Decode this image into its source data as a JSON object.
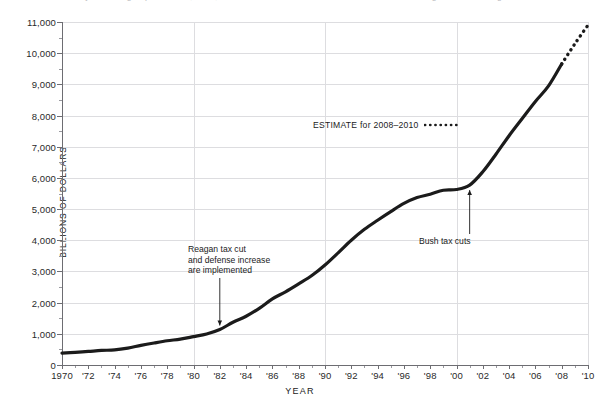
{
  "caption": {
    "text": "fiscal year ending September 30, 2008; 2009 and 2010 are estimates. Source: Office of Management and Budget"
  },
  "chart_data": {
    "type": "line",
    "title": "",
    "subtitle": "",
    "xlabel": "YEAR",
    "ylabel": "BILLIONS OF DOLLARS",
    "xlim": [
      1970,
      2010
    ],
    "ylim": [
      0,
      11000
    ],
    "grid": "major gridlines every 1,000 on y and every 10 years on x",
    "legend_position": "inside-upper-center",
    "y_ticks": [
      0,
      1000,
      2000,
      3000,
      4000,
      5000,
      6000,
      7000,
      8000,
      9000,
      10000,
      11000
    ],
    "y_tick_labels": [
      "0",
      "1,000",
      "2,000",
      "3,000",
      "4,000",
      "5,000",
      "6,000",
      "7,000",
      "8,000",
      "9,000",
      "10,000",
      "11,000"
    ],
    "x_ticks": [
      1970,
      1972,
      1974,
      1976,
      1978,
      1980,
      1982,
      1984,
      1986,
      1988,
      1990,
      1992,
      1994,
      1996,
      1998,
      2000,
      2002,
      2004,
      2006,
      2008,
      2010
    ],
    "x_tick_labels": [
      "1970",
      "'72",
      "'74",
      "'76",
      "'78",
      "'80",
      "'82",
      "'84",
      "'86",
      "'88",
      "'90",
      "'92",
      "'94",
      "'96",
      "'98",
      "'00",
      "'02",
      "'04",
      "'06",
      "'08",
      "'10"
    ],
    "series": [
      {
        "name": "Gross federal debt",
        "style": "solid",
        "color": "#1b1b1b",
        "x": [
          1970,
          1971,
          1972,
          1973,
          1974,
          1975,
          1976,
          1977,
          1978,
          1979,
          1980,
          1981,
          1982,
          1983,
          1984,
          1985,
          1986,
          1987,
          1988,
          1989,
          1990,
          1991,
          1992,
          1993,
          1994,
          1995,
          1996,
          1997,
          1998,
          1999,
          2000,
          2001,
          2002,
          2003,
          2004,
          2005,
          2006,
          2007,
          2008
        ],
        "values": [
          380,
          408,
          436,
          466,
          484,
          542,
          629,
          706,
          777,
          829,
          909,
          994,
          1137,
          1371,
          1564,
          1817,
          2120,
          2346,
          2601,
          2868,
          3206,
          3598,
          4001,
          4351,
          4643,
          4920,
          5181,
          5369,
          5478,
          5605,
          5628,
          5769,
          6198,
          6760,
          7354,
          7905,
          8451,
          8950,
          9654
        ]
      },
      {
        "name": "ESTIMATE for 2008–2010",
        "style": "dotted",
        "color": "#1b1b1b",
        "x": [
          2008,
          2009,
          2010
        ],
        "values": [
          9654,
          10300,
          10900
        ]
      }
    ],
    "annotations": [
      {
        "id": "reagan",
        "text": "Reagan tax cut\nand defense increase\nare implemented",
        "point_x": 1982,
        "point_y": 1137,
        "arrow": "down"
      },
      {
        "id": "bush",
        "text": "Bush tax cuts",
        "point_x": 2001,
        "point_y": 5769,
        "arrow": "up"
      }
    ],
    "legend_entries": [
      {
        "label": "ESTIMATE for 2008–2010",
        "style": "dotted"
      }
    ]
  }
}
